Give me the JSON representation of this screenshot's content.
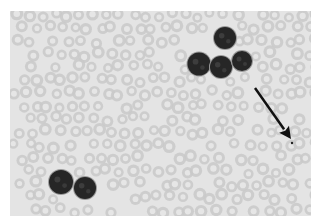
{
  "figure": {
    "type": "blood-smear-micrograph",
    "background_color": "#e4e4e4",
    "rbc_color": "#c9c9c9",
    "rbc_pallor_color": "#e6e6e6",
    "nucleus_color": "#262626",
    "arrow_color": "#111111"
  },
  "cells": {
    "lymphocyte_cluster_top": [
      {
        "cx": 215,
        "cy": 27,
        "r": 11
      },
      {
        "cx": 189,
        "cy": 53,
        "r": 11.5
      },
      {
        "cx": 211,
        "cy": 56,
        "r": 11
      },
      {
        "cx": 232,
        "cy": 50,
        "r": 10
      }
    ],
    "lymphocyte_cluster_bottom": [
      {
        "cx": 51,
        "cy": 171,
        "r": 12
      },
      {
        "cx": 75,
        "cy": 177,
        "r": 11
      }
    ]
  },
  "annotation": {
    "arrow": {
      "x1": 245,
      "y1": 77,
      "x2": 281,
      "y2": 128
    },
    "target_dot": {
      "cx": 282,
      "cy": 132,
      "r": 1.2
    }
  }
}
